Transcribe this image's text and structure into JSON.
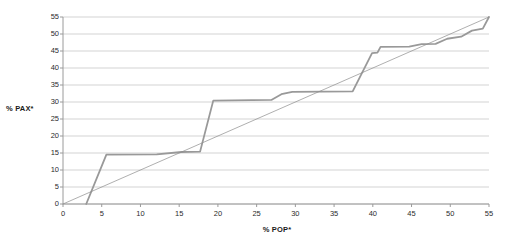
{
  "chart_data": {
    "type": "line",
    "title": "",
    "xlabel": "% POP*",
    "ylabel": "% PAX*",
    "xlim": [
      0,
      55
    ],
    "ylim": [
      0,
      55
    ],
    "xticks": [
      0,
      5,
      10,
      15,
      20,
      25,
      30,
      35,
      40,
      45,
      50,
      55
    ],
    "yticks": [
      0,
      5,
      10,
      15,
      20,
      25,
      30,
      35,
      40,
      45,
      50,
      55
    ],
    "grid": "horizontal",
    "legend": "none",
    "colors": {
      "curve": "#999999",
      "equality_line": "#8c8c8c",
      "gridline": "#c8c8c8",
      "axis": "#9a9a9a",
      "text": "#1a1a1a",
      "background": "#ffffff"
    },
    "series": [
      {
        "name": "Lorenz curve",
        "type": "step-line",
        "color": "#999999",
        "width": 1.8,
        "points": [
          [
            3.0,
            0.0
          ],
          [
            5.6,
            14.5
          ],
          [
            12.1,
            14.6
          ],
          [
            15.3,
            15.3
          ],
          [
            17.7,
            15.4
          ],
          [
            19.4,
            30.4
          ],
          [
            26.9,
            30.6
          ],
          [
            28.2,
            32.3
          ],
          [
            29.6,
            33.0
          ],
          [
            37.4,
            33.1
          ],
          [
            39.9,
            44.4
          ],
          [
            40.6,
            44.5
          ],
          [
            41.0,
            46.2
          ],
          [
            44.7,
            46.3
          ],
          [
            46.3,
            47.0
          ],
          [
            48.1,
            47.1
          ],
          [
            49.6,
            48.6
          ],
          [
            51.4,
            49.2
          ],
          [
            52.8,
            51.0
          ],
          [
            54.2,
            51.6
          ],
          [
            55.0,
            55.0
          ]
        ]
      },
      {
        "name": "Line of equality",
        "type": "line",
        "color": "#8c8c8c",
        "width": 0.7,
        "points": [
          [
            0.0,
            0.0
          ],
          [
            55.0,
            55.0
          ]
        ]
      }
    ]
  }
}
